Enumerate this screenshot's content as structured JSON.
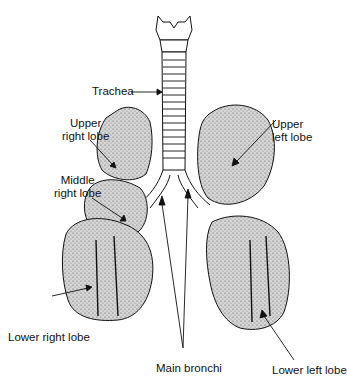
{
  "diagram": {
    "labels": {
      "trachea": "Trachea",
      "upper_right_lobe": [
        "Upper",
        "right lobe"
      ],
      "middle_right_lobe": [
        "Middle",
        "right lobe"
      ],
      "lower_right_lobe": "Lower right lobe",
      "upper_left_lobe": [
        "Upper",
        "left lobe"
      ],
      "lower_left_lobe": "Lower left lobe",
      "main_bronchi": "Main bronchi"
    },
    "colors": {
      "background": "#ffffff",
      "ink": "#111111",
      "lung_fill": "#c9c9c9"
    }
  }
}
